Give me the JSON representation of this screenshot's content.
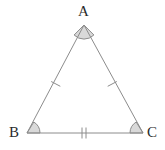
{
  "figure": {
    "name": "isosceles-triangle-abc",
    "background_color": "#ffffff",
    "stroke_color": "#8c8c8c",
    "arc_fill_color": "#d9d9d9",
    "arc_stroke_color": "#8c8c8c",
    "tick_color": "#8c8c8c",
    "label_color": "#2b2b2b",
    "stroke_width": 1
  },
  "vertices": [
    {
      "id": "A",
      "label": "A",
      "x": 84,
      "y": 25,
      "label_x": 78,
      "label_y": 4
    },
    {
      "id": "B",
      "label": "B",
      "x": 27,
      "y": 133,
      "label_x": 9,
      "label_y": 125
    },
    {
      "id": "C",
      "label": "C",
      "x": 143,
      "y": 133,
      "label_x": 147,
      "label_y": 125
    }
  ],
  "sides": [
    {
      "id": "AB",
      "from": "A",
      "to": "B",
      "tick_count": 1,
      "congruence_group": "legs"
    },
    {
      "id": "AC",
      "from": "A",
      "to": "C",
      "tick_count": 1,
      "congruence_group": "legs"
    },
    {
      "id": "BC",
      "from": "B",
      "to": "C",
      "tick_count": 2,
      "congruence_group": "base"
    }
  ],
  "angle_marks": [
    {
      "id": "angle-A",
      "vertex": "A",
      "radius": 14,
      "filled": true
    },
    {
      "id": "angle-B",
      "vertex": "B",
      "radius": 13,
      "filled": true
    },
    {
      "id": "angle-C",
      "vertex": "C",
      "radius": 13,
      "filled": true
    }
  ],
  "geometry_paths": {
    "triangle_outline": "M 84 25 L 27 133 L 143 133 Z",
    "arc_A": "M 74.1 35.0 A 14 14 0 0 0 93.9 35.0 L 84 25 Z",
    "arc_B": "M 40 133 A 13 13 0 0 0 33.8 122.0 L 27 133 Z",
    "arc_C": "M 136.2 122.0 A 13 13 0 0 0 130 133 L 143 133 Z",
    "tick_AB": "M 51.2 81.5 L 60.3 86.3",
    "tick_AC": "M 107.7 86.3 L 116.8 81.5",
    "tick_BC_1": "M 82 127.5 L 82 138.5",
    "tick_BC_2": "M 86 127.5 L 86 138.5"
  }
}
